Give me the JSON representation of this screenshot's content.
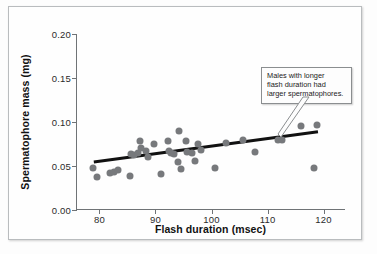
{
  "chart_data": {
    "type": "scatter",
    "title": "",
    "xlabel": "Flash duration (msec)",
    "ylabel": "Spermatophore mass (mg)",
    "xlim": [
      76,
      124
    ],
    "ylim": [
      0.0,
      0.2
    ],
    "xticks": [
      80,
      90,
      100,
      110,
      120
    ],
    "xtick_labels": [
      "80",
      "90",
      "100",
      "110",
      "120"
    ],
    "yticks": [
      0.0,
      0.05,
      0.1,
      0.15,
      0.2
    ],
    "ytick_labels": [
      "0.00",
      "0.05",
      "0.10",
      "0.15",
      "0.20"
    ],
    "grid": false,
    "legend": null,
    "point_color": "#77797c",
    "trendline_color": "#111111",
    "axis_color": "#6f7376",
    "points": [
      {
        "x": 78.9,
        "y": 0.048
      },
      {
        "x": 79.6,
        "y": 0.038
      },
      {
        "x": 81.8,
        "y": 0.042
      },
      {
        "x": 82.6,
        "y": 0.043
      },
      {
        "x": 83.3,
        "y": 0.046
      },
      {
        "x": 85.4,
        "y": 0.039
      },
      {
        "x": 85.7,
        "y": 0.064
      },
      {
        "x": 86.1,
        "y": 0.062
      },
      {
        "x": 86.8,
        "y": 0.065
      },
      {
        "x": 87.3,
        "y": 0.078
      },
      {
        "x": 87.5,
        "y": 0.07
      },
      {
        "x": 88.3,
        "y": 0.067
      },
      {
        "x": 88.6,
        "y": 0.06
      },
      {
        "x": 89.8,
        "y": 0.075
      },
      {
        "x": 91.0,
        "y": 0.041
      },
      {
        "x": 92.2,
        "y": 0.078
      },
      {
        "x": 92.4,
        "y": 0.067
      },
      {
        "x": 92.8,
        "y": 0.065
      },
      {
        "x": 93.3,
        "y": 0.064
      },
      {
        "x": 94.2,
        "y": 0.09
      },
      {
        "x": 94.0,
        "y": 0.055
      },
      {
        "x": 94.6,
        "y": 0.047
      },
      {
        "x": 95.4,
        "y": 0.078
      },
      {
        "x": 95.6,
        "y": 0.066
      },
      {
        "x": 96.5,
        "y": 0.065
      },
      {
        "x": 97.1,
        "y": 0.056
      },
      {
        "x": 97.6,
        "y": 0.075
      },
      {
        "x": 98.2,
        "y": 0.068
      },
      {
        "x": 100.6,
        "y": 0.048
      },
      {
        "x": 102.6,
        "y": 0.076
      },
      {
        "x": 105.7,
        "y": 0.08
      },
      {
        "x": 107.8,
        "y": 0.066
      },
      {
        "x": 111.9,
        "y": 0.08
      },
      {
        "x": 112.6,
        "y": 0.079
      },
      {
        "x": 115.9,
        "y": 0.095
      },
      {
        "x": 118.3,
        "y": 0.048
      },
      {
        "x": 118.9,
        "y": 0.097
      }
    ],
    "trendline": {
      "x0": 79.0,
      "y0": 0.0545,
      "x1": 119.0,
      "y1": 0.089
    }
  },
  "annotation": {
    "text": "Males with longer flash duration had larger spermatophores.",
    "line1": "Males with longer",
    "line2": "flash duration had",
    "line3": "larger spermatophores."
  }
}
